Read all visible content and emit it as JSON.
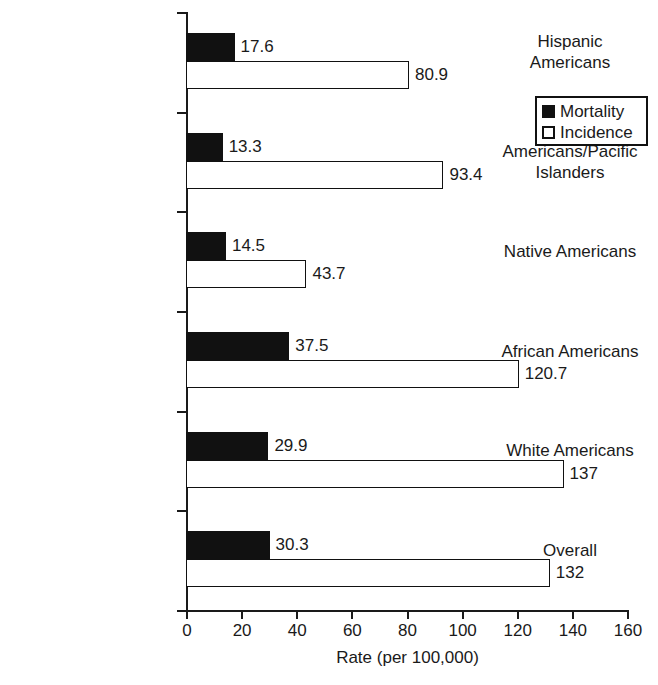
{
  "chart_data": {
    "type": "bar",
    "orientation": "horizontal",
    "title": "",
    "xlabel": "Rate (per 100,000)",
    "ylabel": "",
    "xlim": [
      0,
      160
    ],
    "xticks": [
      "0",
      "20",
      "40",
      "60",
      "80",
      "100",
      "120",
      "140",
      "160"
    ],
    "grid": false,
    "legend_position": "top-right",
    "categories": [
      "Hispanic Americans",
      "Asian Americans/Pacific Islanders",
      "Native Americans",
      "African Americans",
      "White Americans",
      "Overall"
    ],
    "category_lines": [
      [
        "Hispanic",
        "Americans"
      ],
      [
        "Asian",
        "Americans/Pacific",
        "Islanders"
      ],
      [
        "Native Americans"
      ],
      [
        "African Americans"
      ],
      [
        "White Americans"
      ],
      [
        "Overall"
      ]
    ],
    "series": [
      {
        "name": "Mortality",
        "style": "filled",
        "color": "#111111",
        "values": [
          17.6,
          13.3,
          14.5,
          37.5,
          29.9,
          30.3
        ],
        "labels": [
          "17.6",
          "13.3",
          "14.5",
          "37.5",
          "29.9",
          "30.3"
        ]
      },
      {
        "name": "Incidence",
        "style": "hollow",
        "color": "#ffffff",
        "values": [
          80.9,
          93.4,
          43.7,
          120.7,
          137,
          132
        ],
        "labels": [
          "80.9",
          "93.4",
          "43.7",
          "120.7",
          "137",
          "132"
        ]
      }
    ]
  },
  "legend": {
    "items": [
      {
        "label": "Mortality",
        "style": "filled"
      },
      {
        "label": "Incidence",
        "style": "hollow"
      }
    ]
  },
  "axis": {
    "x_title": "Rate (per 100,000)"
  }
}
